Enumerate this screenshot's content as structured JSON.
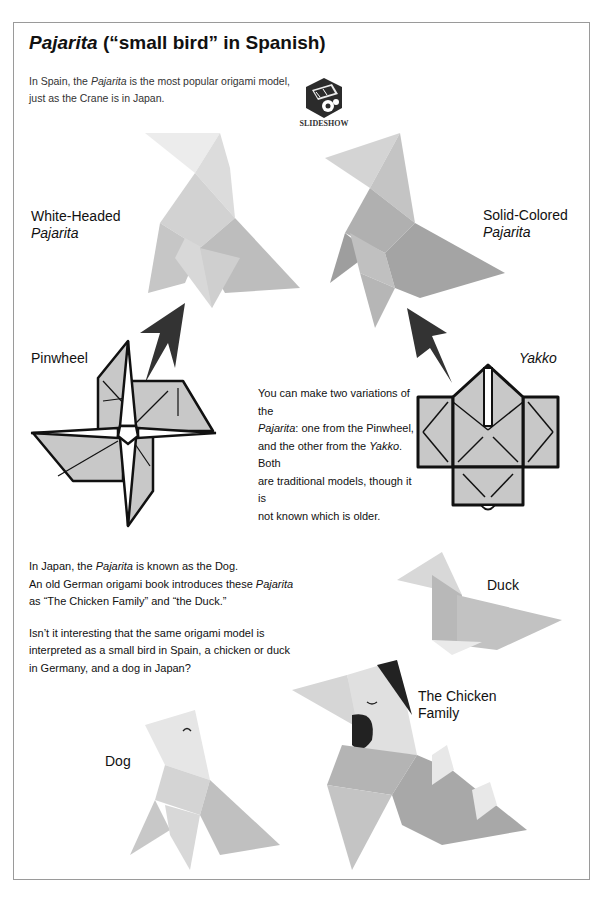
{
  "page": {
    "title": {
      "italic": "Pajarita",
      "rest": " (“small bird” in Spanish)"
    },
    "intro": {
      "line1_pre": "In Spain, the ",
      "line1_italic": "Pajarita",
      "line1_post": " is the most popular origami model,",
      "line2": "just as the Crane is in Japan."
    },
    "slideshow": {
      "label": "SLIDESHOW",
      "icon": "film-reel-cube-icon"
    },
    "labels": {
      "white_headed": {
        "line1": "White-Headed",
        "line2": "Pajarita"
      },
      "solid_colored": {
        "line1": "Solid-Colored",
        "line2": "Pajarita"
      },
      "pinwheel": "Pinwheel",
      "yakko": "Yakko",
      "duck": "Duck",
      "chicken_family": {
        "line1": "The Chicken",
        "line2": "Family"
      },
      "dog": "Dog"
    },
    "variations_text": {
      "l1": "You can make two variations of the",
      "l2_italic": "Pajarita",
      "l2_rest": ": one from the Pinwheel,",
      "l3_pre": "and the other from the ",
      "l3_italic": "Yakko",
      "l3_post": ". Both",
      "l4": "are traditional models, though it is",
      "l5": "not known which is older."
    },
    "japan_text": {
      "l1_pre": "In Japan, the ",
      "l1_italic": "Pajarita",
      "l1_post": " is known as the Dog.",
      "l2_pre": "An old German origami book introduces these ",
      "l2_italic": "Pajarita",
      "l3": "as “The Chicken Family” and “the Duck.”",
      "l4": "Isn’t it interesting that the same origami model is",
      "l5": "interpreted as a small bird in Spain, a chicken or duck",
      "l6": "in Germany, and a dog in Japan?"
    },
    "colors": {
      "diagram_fill": "#c8c8c8",
      "arrow": "#333333",
      "frame_border": "#9a9a9a"
    }
  }
}
